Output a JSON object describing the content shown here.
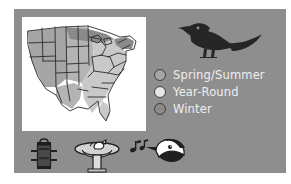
{
  "figure": {
    "kind": "bird-range-map-infographic",
    "panel_background_color": "#8e8e8e",
    "page_background_color": "#ffffff"
  },
  "map": {
    "name": "united-states-range-map",
    "plate_background_color": "#ffffff",
    "outline_color": "#2b2b2b",
    "regions": [
      {
        "id": "west-spring-summer",
        "shade_color": "#a5a5a5",
        "range_class": "Spring/Summer"
      },
      {
        "id": "central-east-year-round",
        "shade_color": "#c9c9c9",
        "range_class": "Year-Round"
      },
      {
        "id": "north-winter",
        "shade_color": "#8a8a8a",
        "range_class": "Winter"
      }
    ]
  },
  "bird": {
    "name": "grackle-silhouette",
    "fill_color": "#262626",
    "facing": "left"
  },
  "legend": {
    "items": [
      {
        "label": "Spring/Summer",
        "swatch_color": "#a5a5a5",
        "swatch_border_color": "#3f3f3f"
      },
      {
        "label": "Year-Round",
        "swatch_color": "#e6e6e6",
        "swatch_border_color": "#3f3f3f"
      },
      {
        "label": "Winter",
        "swatch_color": "#8a8a8a",
        "swatch_border_color": "#3f3f3f"
      }
    ],
    "text_color": "#efefef"
  },
  "icons": [
    {
      "name": "tube-bird-feeder-icon",
      "label": "Tube feeder"
    },
    {
      "name": "birdbath-icon",
      "label": "Birdbath"
    },
    {
      "name": "bird-song-icon",
      "label": "Bird song"
    }
  ]
}
